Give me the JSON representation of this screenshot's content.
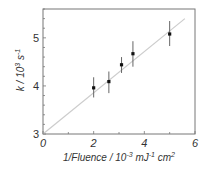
{
  "chart_data": {
    "type": "scatter",
    "title": "",
    "xlabel": "1/Fluence / 10^-3 mJ^-1 cm^2",
    "ylabel": "k / 10^3 s^-1",
    "xlim": [
      0,
      6
    ],
    "ylim": [
      3,
      5.6
    ],
    "x_ticks": [
      0,
      2,
      4,
      6
    ],
    "y_ticks": [
      3,
      4,
      5
    ],
    "grid": false,
    "legend": null,
    "series": [
      {
        "name": "data",
        "x": [
          2.0,
          2.6,
          3.1,
          3.55,
          5.0
        ],
        "y": [
          3.96,
          4.09,
          4.44,
          4.67,
          5.08
        ],
        "err_low": [
          3.76,
          3.85,
          4.27,
          4.4,
          4.83
        ],
        "err_high": [
          4.18,
          4.3,
          4.6,
          4.93,
          5.35
        ]
      },
      {
        "name": "linear fit",
        "x": [
          0,
          5.6
        ],
        "y": [
          3.0,
          5.4
        ]
      }
    ],
    "colors": {
      "points": "#111111",
      "errorbars": "#666666",
      "fit": "#cccccc",
      "frame": "#777777"
    }
  },
  "labels": {
    "x_ticks": [
      "0",
      "2",
      "4",
      "6"
    ],
    "y_ticks": [
      "3",
      "4",
      "5"
    ],
    "xlabel_main": "1/Fluence / 10",
    "xlabel_exp1": "-3",
    "xlabel_mid": " mJ",
    "xlabel_exp2": "-1",
    "xlabel_end": " cm",
    "xlabel_exp3": "2",
    "ylabel_k": "k",
    "ylabel_main": " / 10",
    "ylabel_exp1": "3",
    "ylabel_s": " s",
    "ylabel_exp2": "-1"
  }
}
